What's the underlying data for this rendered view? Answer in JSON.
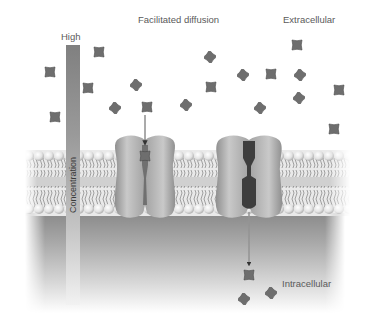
{
  "diagram": {
    "title": "Facilitated diffusion",
    "regions": {
      "extracellular": "Extracellular",
      "intracellular": "Intracellular"
    },
    "gradient": {
      "high_label": "High",
      "axis_label": "Concentration"
    },
    "channels": [
      {
        "name": "channel-protein-with-solute",
        "state": "solute inside channel"
      },
      {
        "name": "channel-protein-open",
        "state": "solute released to intracellular side"
      }
    ],
    "particles": {
      "extracellular": [
        {
          "x": 50,
          "y": 72,
          "shape": "square"
        },
        {
          "x": 88,
          "y": 88,
          "shape": "square"
        },
        {
          "x": 99,
          "y": 52,
          "shape": "square"
        },
        {
          "x": 115,
          "y": 108,
          "shape": "diamond"
        },
        {
          "x": 136,
          "y": 85,
          "shape": "diamond"
        },
        {
          "x": 147,
          "y": 107,
          "shape": "square"
        },
        {
          "x": 55,
          "y": 117,
          "shape": "square"
        },
        {
          "x": 186,
          "y": 105,
          "shape": "diamond"
        },
        {
          "x": 210,
          "y": 57,
          "shape": "diamond"
        },
        {
          "x": 211,
          "y": 87,
          "shape": "square"
        },
        {
          "x": 243,
          "y": 75,
          "shape": "diamond"
        },
        {
          "x": 271,
          "y": 74,
          "shape": "square"
        },
        {
          "x": 297,
          "y": 45,
          "shape": "square"
        },
        {
          "x": 300,
          "y": 75,
          "shape": "diamond"
        },
        {
          "x": 299,
          "y": 98,
          "shape": "diamond"
        },
        {
          "x": 260,
          "y": 108,
          "shape": "diamond"
        },
        {
          "x": 339,
          "y": 90,
          "shape": "square"
        },
        {
          "x": 334,
          "y": 129,
          "shape": "square"
        }
      ],
      "in_channel": [
        {
          "x": 145,
          "y": 156,
          "shape": "square"
        }
      ],
      "intracellular": [
        {
          "x": 249,
          "y": 275,
          "shape": "square"
        },
        {
          "x": 244,
          "y": 299,
          "shape": "diamond"
        },
        {
          "x": 271,
          "y": 293,
          "shape": "diamond"
        }
      ]
    },
    "colors": {
      "particle": "#6e6e6e",
      "protein": "#b5b5b5",
      "channel_pore": "#4a4a4a",
      "lipid_head": "#e6e6e6",
      "text": "#5a5a5a"
    }
  }
}
